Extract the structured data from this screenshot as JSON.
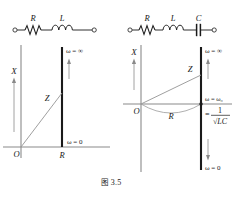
{
  "figure": {
    "caption_prefix": "图",
    "caption_number": "3.5",
    "colors": {
      "ink": "#1a1a1a",
      "axis": "#6b6b6b",
      "locus": "#1a1a1a",
      "vector": "#7a7a7a",
      "background": "#ffffff"
    },
    "panels": [
      {
        "id": "left-panel",
        "name": "series-rl-impedance-locus",
        "circuit": {
          "name": "series-rl-circuit",
          "components": [
            {
              "type": "resistor",
              "label": "R"
            },
            {
              "type": "inductor",
              "label": "L"
            }
          ],
          "terminals": [
            "open-circle-left",
            "open-circle-right"
          ]
        },
        "plot": {
          "vertical_axis_label": "X",
          "origin_label": "O",
          "locus_foot_label": "R",
          "impedance_vector_label": "Z",
          "annotation_top": "ω = ∞",
          "annotation_bottom": "ω = 0",
          "locus_type": "vertical-straight-line",
          "arrow_direction": "up"
        }
      },
      {
        "id": "right-panel",
        "name": "series-rlc-impedance-locus",
        "circuit": {
          "name": "series-rlc-circuit",
          "components": [
            {
              "type": "resistor",
              "label": "R"
            },
            {
              "type": "inductor",
              "label": "L"
            },
            {
              "type": "capacitor",
              "label": "C"
            }
          ],
          "terminals": [
            "open-circle-left",
            "open-circle-right"
          ]
        },
        "plot": {
          "vertical_axis_label": "X",
          "origin_label": "O",
          "arc_label": "R",
          "impedance_vector_label": "Z",
          "annotation_resonance_line1": "ω = ω₀",
          "annotation_resonance_line2_prefix": "=",
          "annotation_resonance_numerator": "1",
          "annotation_resonance_denominator": "√LC",
          "annotation_top": "ω = ∞",
          "annotation_bottom": "ω = 0",
          "locus_type": "vertical-straight-line",
          "arrow_direction_top": "up",
          "arrow_direction_bottom": "down"
        }
      }
    ]
  }
}
